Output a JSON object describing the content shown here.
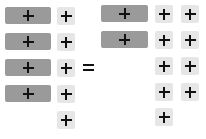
{
  "title": "Algebra tiles equation",
  "colors": {
    "long_tile": "#9a9a9a",
    "unit_tile": "#e6e6e6",
    "sign": "#111111"
  },
  "equation": {
    "operator": "=",
    "left": {
      "x_tiles": 4,
      "unit_tiles": 5,
      "sign": "+"
    },
    "right": {
      "x_tiles": 2,
      "unit_tiles": 9,
      "sign": "+"
    }
  },
  "legend": {
    "long_tile": "+x",
    "unit_tile": "+1"
  }
}
